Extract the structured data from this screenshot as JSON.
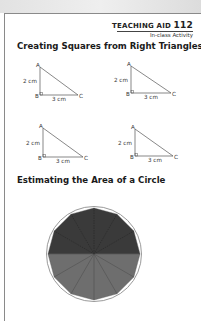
{
  "header": {
    "label": "TEACHING AID",
    "number": "112",
    "subtitle": "In-class Activity"
  },
  "sections": [
    {
      "title": "Creating Squares from Right Triangles",
      "triangles": [
        {
          "A": "A",
          "B": "B",
          "C": "C",
          "side_AB": "2 cm",
          "side_BC": "3 cm"
        },
        {
          "A": "A",
          "B": "B",
          "C": "C",
          "side_AB": "2 cm",
          "side_BC": "3 cm"
        },
        {
          "A": "A",
          "B": "B",
          "C": "C",
          "side_AB": "2 cm",
          "side_BC": "3 cm"
        },
        {
          "A": "A",
          "B": "B",
          "C": "C",
          "side_AB": "2 cm",
          "side_BC": "3 cm"
        }
      ]
    },
    {
      "title": "Estimating the Area of a Circle",
      "figure": {
        "shape": "circle with inscribed 12-sided polygon divided into 12 sectors",
        "top_half_color": "#3a3a3a",
        "bottom_half_color": "#6e6e6e",
        "outline_color": "#9a9a9a"
      }
    }
  ]
}
